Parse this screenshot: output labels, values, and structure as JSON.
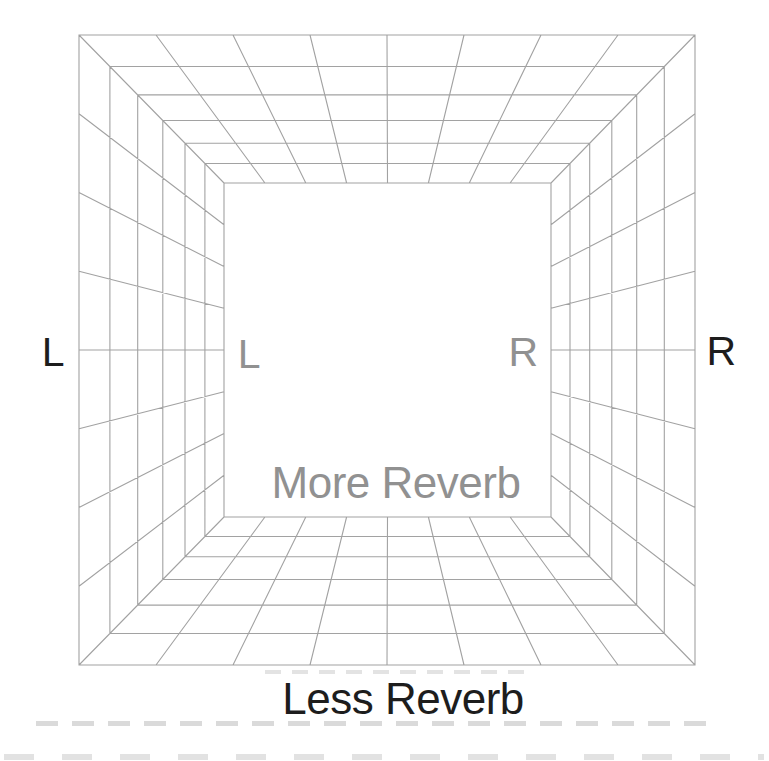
{
  "figure": {
    "labels": {
      "outer_left": "L",
      "inner_left": "L",
      "inner_right": "R",
      "outer_right": "R",
      "back_wall": "More Reverb",
      "front_caption": "Less Reverb"
    },
    "colors": {
      "line": "#a2a2a2",
      "dark_text": "#1d1d1d",
      "gray_text": "#919191",
      "background": "#ffffff"
    },
    "geometry": {
      "canvas": {
        "width": 769,
        "height": 761
      },
      "outer_rect": {
        "x1": 79,
        "y1": 35,
        "x2": 695,
        "y2": 665
      },
      "inner_rect": {
        "x1": 224,
        "y1": 183,
        "x2": 551,
        "y2": 517
      },
      "edge_divisions": 8,
      "depth_fractions": [
        0,
        0.213,
        0.405,
        0.578,
        0.731,
        0.868,
        1
      ],
      "line_width": 1.1
    }
  }
}
